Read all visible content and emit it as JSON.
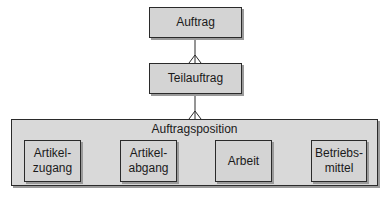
{
  "diagram": {
    "nodes": {
      "auftrag": {
        "label": "Auftrag"
      },
      "teilauftrag": {
        "label": "Teilauftrag"
      },
      "auftragsposition": {
        "label": "Auftragsposition",
        "children": [
          {
            "label": "Artikel-\nzugang"
          },
          {
            "label": "Artikel-\nabgang"
          },
          {
            "label": "Arbeit"
          },
          {
            "label": "Betriebs-\nmittel"
          }
        ]
      }
    },
    "relations": [
      {
        "from": "Auftrag",
        "to": "Teilauftrag",
        "type": "one-to-many"
      },
      {
        "from": "Teilauftrag",
        "to": "Auftragsposition",
        "type": "one-to-many"
      }
    ],
    "colors": {
      "box_fill": "#d4d4d4",
      "border": "#2a2a2a",
      "shadow": "#9a9a9a"
    }
  }
}
